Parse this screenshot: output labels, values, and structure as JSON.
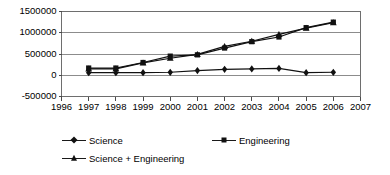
{
  "chart_data": {
    "type": "line",
    "title": "",
    "xlabel": "",
    "ylabel": "",
    "x": [
      1997,
      1998,
      1999,
      2000,
      2001,
      2002,
      2003,
      2004,
      2005,
      2006
    ],
    "xlim": [
      1996,
      2007
    ],
    "ylim": [
      -500000,
      1500000
    ],
    "grid": true,
    "legend_position": "bottom",
    "xtick_labels": [
      "1996",
      "1997",
      "1998",
      "1999",
      "2000",
      "2001",
      "2002",
      "2003",
      "2004",
      "2005",
      "2006",
      "2007"
    ],
    "ytick_labels": [
      "1500000",
      "1000000",
      "500000",
      "0",
      "-500000"
    ],
    "ytick_values": [
      1500000,
      1000000,
      500000,
      0,
      -500000
    ],
    "series": [
      {
        "name": "Science",
        "marker": "diamond",
        "color": "#111111",
        "values": [
          60000,
          60000,
          60000,
          70000,
          110000,
          140000,
          150000,
          160000,
          60000,
          70000
        ]
      },
      {
        "name": "Engineering",
        "marker": "square",
        "color": "#111111",
        "values": [
          170000,
          170000,
          300000,
          450000,
          480000,
          640000,
          790000,
          900000,
          1120000,
          1250000
        ]
      },
      {
        "name": "Science + Engineering",
        "marker": "triangle",
        "color": "#111111",
        "values": [
          150000,
          150000,
          290000,
          400000,
          490000,
          680000,
          800000,
          960000,
          1110000,
          1240000
        ]
      }
    ]
  },
  "legend": {
    "items": [
      {
        "label": "Science",
        "marker": "diamond"
      },
      {
        "label": "Engineering",
        "marker": "square"
      },
      {
        "label": "Science + Engineering",
        "marker": "triangle"
      }
    ]
  }
}
